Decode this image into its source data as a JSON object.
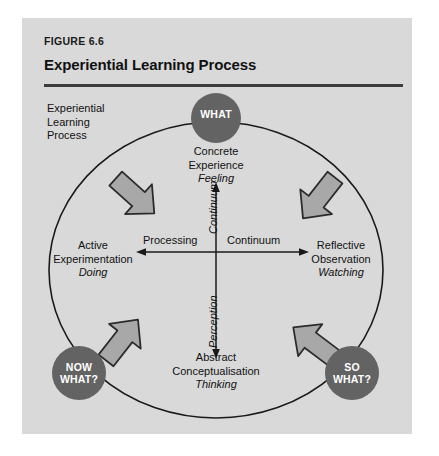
{
  "figure": {
    "label": "FIGURE 6.6",
    "title": "Experiential Learning Process"
  },
  "diagram": {
    "caption": {
      "line1": "Experiential",
      "line2": "Learning",
      "line3": "Process"
    },
    "nodes": [
      {
        "id": "concrete-experience",
        "line1": "Concrete",
        "line2": "Experience",
        "mode": "Feeling"
      },
      {
        "id": "reflective-observation",
        "line1": "Reflective",
        "line2": "Observation",
        "mode": "Watching"
      },
      {
        "id": "abstract-conceptualisation",
        "line1": "Abstract",
        "line2": "Conceptualisation",
        "mode": "Thinking"
      },
      {
        "id": "active-experimentation",
        "line1": "Active",
        "line2": "Experimentation",
        "mode": "Doing"
      }
    ],
    "axes": {
      "horizontal_left": "Processing",
      "horizontal_right": "Continuum",
      "vertical_lower": "Perception",
      "vertical_upper": "Continuum"
    },
    "circles": [
      {
        "id": "what",
        "line1": "WHAT",
        "line2": ""
      },
      {
        "id": "now-what",
        "line1": "NOW",
        "line2": "WHAT?"
      },
      {
        "id": "so-what",
        "line1": "SO",
        "line2": "WHAT?"
      }
    ],
    "arrows": [
      {
        "id": "arrow-top-left",
        "direction": "up-right"
      },
      {
        "id": "arrow-top-right",
        "direction": "down-right"
      },
      {
        "id": "arrow-bottom-right",
        "direction": "down-left"
      },
      {
        "id": "arrow-bottom-left",
        "direction": "up-left"
      }
    ]
  },
  "colors": {
    "panel_background": "#d9d9d9",
    "circle_fill": "#636363",
    "circle_text": "#ffffff",
    "arrow_fill": "#a8a8a8",
    "arrow_stroke": "#2b2b2b",
    "line": "#1a1a1a",
    "rule": "#3d3d3d",
    "text": "#111111"
  }
}
